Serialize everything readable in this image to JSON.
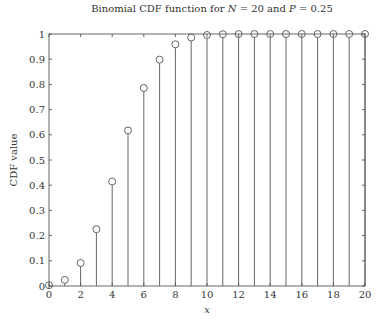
{
  "chart_data": {
    "type": "stem",
    "title": "Binomial CDF function for N = 20 and P = 0.25",
    "title_parts": {
      "prefix": "Binomial CDF function for ",
      "n_symbol": "N",
      "n_value": " = 20 and ",
      "p_symbol": "P",
      "p_value": " = 0.25"
    },
    "xlabel": "x",
    "ylabel": "CDF value",
    "xlim": [
      0,
      20
    ],
    "ylim": [
      0,
      1
    ],
    "xticks": [
      0,
      2,
      4,
      6,
      8,
      10,
      12,
      14,
      16,
      18,
      20
    ],
    "yticks": [
      0,
      0.1,
      0.2,
      0.3,
      0.4,
      0.5,
      0.6,
      0.7,
      0.8,
      0.9,
      1
    ],
    "ytick_labels": [
      "0",
      "0.1",
      "0.2",
      "0.3",
      "0.4",
      "0.5",
      "0.6",
      "0.7",
      "0.8",
      "0.9",
      "1"
    ],
    "grid": false,
    "marker": "circle",
    "x": [
      0,
      1,
      2,
      3,
      4,
      5,
      6,
      7,
      8,
      9,
      10,
      11,
      12,
      13,
      14,
      15,
      16,
      17,
      18,
      19,
      20
    ],
    "values": [
      0.0032,
      0.0243,
      0.0913,
      0.2252,
      0.4148,
      0.6172,
      0.7858,
      0.8982,
      0.9591,
      0.9861,
      0.9961,
      0.9991,
      0.9998,
      1.0,
      1.0,
      1.0,
      1.0,
      1.0,
      1.0,
      1.0,
      1.0
    ],
    "colors": {
      "stem": "#555555",
      "axis": "#444444",
      "text": "#333333"
    }
  }
}
